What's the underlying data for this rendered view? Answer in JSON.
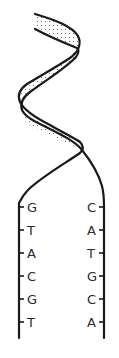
{
  "diagram": {
    "left_strand": {
      "bases": [
        "G",
        "T",
        "A",
        "C",
        "G",
        "T"
      ]
    },
    "right_strand": {
      "bases": [
        "C",
        "A",
        "T",
        "G",
        "C",
        "A"
      ]
    },
    "colors": {
      "stroke": "#1a1a1a",
      "text": "#2a2a2a",
      "dots": "#555555",
      "background": "#ffffff"
    }
  }
}
